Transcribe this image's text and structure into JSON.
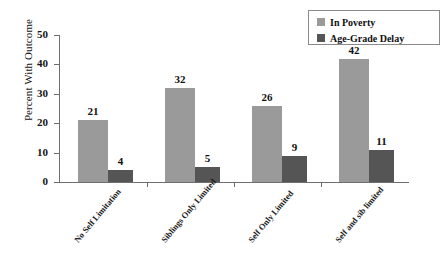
{
  "chart_data": {
    "type": "bar",
    "title": "",
    "subtitle": "",
    "xlabel": "",
    "ylabel": "Percent With Outcome",
    "ylim": [
      0,
      50
    ],
    "yticks": [
      0,
      10,
      20,
      30,
      40,
      50
    ],
    "grid": false,
    "legend_position": "top-right",
    "categories": [
      "No Self Limitation",
      "Siblings Only Limited",
      "Self Only Limited",
      "Self and sib limited"
    ],
    "series": [
      {
        "name": "In Poverty",
        "color": "#9a9a9a",
        "values": [
          21,
          32,
          26,
          42
        ],
        "labels": [
          "21",
          "32",
          "26",
          "42"
        ]
      },
      {
        "name": "Age-Grade Delay",
        "color": "#555555",
        "values": [
          4,
          5,
          9,
          11
        ],
        "labels": [
          "4",
          "5",
          "9",
          "11"
        ]
      }
    ]
  },
  "axis": {
    "y_title": "Percent With Outcome",
    "y_tick_labels": [
      "50",
      "40",
      "30",
      "20",
      "10",
      "0"
    ]
  },
  "legend": {
    "items": [
      {
        "label": "In Poverty",
        "color": "#9a9a9a"
      },
      {
        "label": "Age-Grade Delay",
        "color": "#555555"
      }
    ]
  }
}
